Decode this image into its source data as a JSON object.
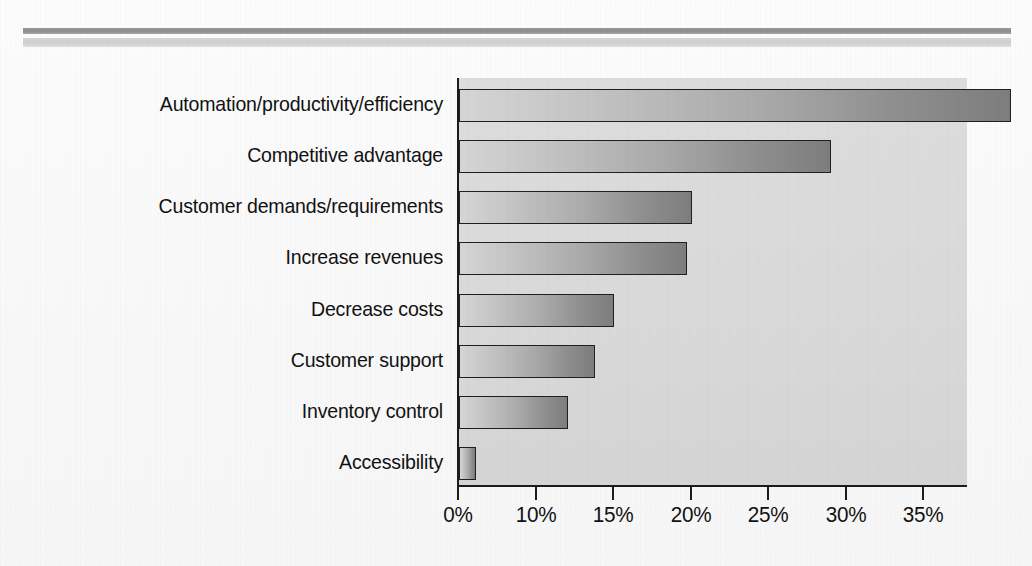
{
  "chart_data": {
    "type": "bar",
    "orientation": "horizontal",
    "title": "",
    "subtitle": "",
    "xlabel": "",
    "ylabel": "",
    "grid": false,
    "legend": null,
    "categories": [
      "Automation/productivity/efficiency",
      "Competitive advantage",
      "Customer demands/requirements",
      "Increase revenues",
      "Decrease costs",
      "Customer support",
      "Inventory control",
      "Accessibility"
    ],
    "values": [
      35.6,
      24.0,
      15.0,
      14.7,
      10.0,
      8.8,
      7.0,
      1.1
    ],
    "value_suffix": "%",
    "xlim": [
      0,
      36.5
    ],
    "axis_ticks": [
      {
        "label": "0%",
        "value": 0
      },
      {
        "label": "10%",
        "value": 5
      },
      {
        "label": "15%",
        "value": 10
      },
      {
        "label": "20%",
        "value": 15
      },
      {
        "label": "25%",
        "value": 20
      },
      {
        "label": "30%",
        "value": 25
      },
      {
        "label": "35%",
        "value": 30
      }
    ],
    "tick_labels": [
      "0%",
      "10%",
      "15%",
      "20%",
      "25%",
      "30%",
      "35%"
    ],
    "colors": {
      "plot_background": "#d9d9d9",
      "bar_gradient_start": "#d5d5d5",
      "bar_gradient_end": "#7d7d7d",
      "bar_border": "#1f1f1f",
      "axis": "#1b1b1b",
      "text": "#111111",
      "page_background": "#ffffff",
      "rule_dark": "#8c8c8c",
      "rule_light": "#d6d6d6"
    }
  },
  "decor": {
    "rule_dark_name": "top-rule-dark",
    "rule_light_name": "top-rule-light"
  }
}
